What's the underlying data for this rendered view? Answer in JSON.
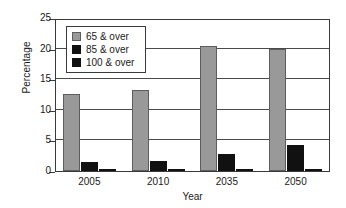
{
  "chart_data": {
    "type": "bar",
    "title": "",
    "xlabel": "Year",
    "ylabel": "Percentage",
    "categories": [
      "2005",
      "2010",
      "2035",
      "2050"
    ],
    "series": [
      {
        "name": "65 & over",
        "values": [
          12.6,
          13.2,
          20.4,
          19.9
        ],
        "color": "#999999"
      },
      {
        "name": "85 & over",
        "values": [
          1.5,
          1.7,
          2.7,
          4.2
        ],
        "color": "#111111"
      },
      {
        "name": "100 & over",
        "values": [
          0.02,
          0.03,
          0.15,
          0.25
        ],
        "color": "#111111"
      }
    ],
    "ylim": [
      0,
      25
    ],
    "yticks": [
      "0",
      "5",
      "10",
      "15",
      "20",
      "25"
    ],
    "ytick_values": [
      0,
      5,
      10,
      15,
      20,
      25
    ],
    "grid": true,
    "legend_position": "upper-left",
    "frame_color": "#3a3a3a"
  }
}
